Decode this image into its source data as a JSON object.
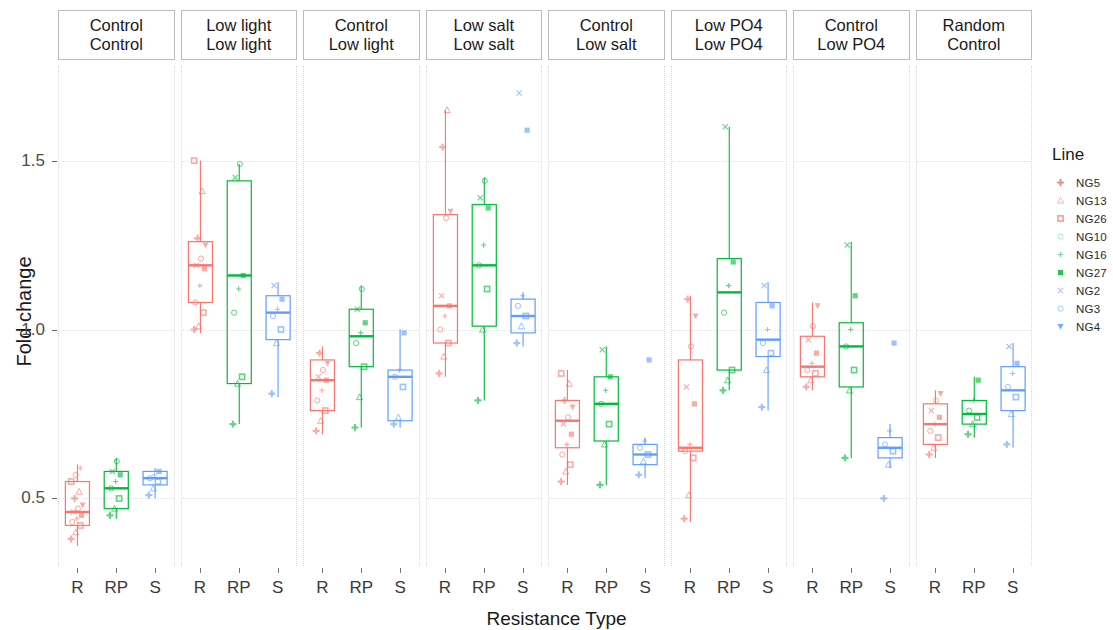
{
  "chart_data": {
    "type": "box",
    "title": "",
    "xlabel": "Resistance Type",
    "ylabel": "Fold change",
    "ylim": [
      0.3,
      1.78
    ],
    "yticks": [
      0.5,
      1.0,
      1.5
    ],
    "ytick_labels": [
      "0.5",
      "1.0",
      "1.5"
    ],
    "categories": [
      "R",
      "RP",
      "S"
    ],
    "grid": true,
    "legend_position": "right",
    "legend_title": "Line",
    "legend_entries": [
      {
        "label": "NG5",
        "shape": "plus-circle",
        "color": "#F8766D"
      },
      {
        "label": "NG13",
        "shape": "triangle",
        "color": "#FBA7A1"
      },
      {
        "label": "NG26",
        "shape": "square-x",
        "color": "#F08D86"
      },
      {
        "label": "NG10",
        "shape": "circle-open",
        "color": "#9FE3B9"
      },
      {
        "label": "NG16",
        "shape": "plus",
        "color": "#63C98A"
      },
      {
        "label": "NG27",
        "shape": "square",
        "color": "#00BA38"
      },
      {
        "label": "NG2",
        "shape": "cross",
        "color": "#A8B9F5"
      },
      {
        "label": "NG3",
        "shape": "circle-open",
        "color": "#8FC3F5"
      },
      {
        "label": "NG4",
        "shape": "triangle-down",
        "color": "#619CFF"
      }
    ],
    "group_colors": {
      "R": "#F8766D",
      "RP": "#00BA38",
      "S": "#619CFF"
    },
    "panels": [
      {
        "header_top": "Control",
        "header_bottom": "Control",
        "boxes": [
          {
            "group": "R",
            "lower_whisker": 0.36,
            "q1": 0.42,
            "median": 0.46,
            "q3": 0.55,
            "upper_whisker": 0.6,
            "points": [
              0.38,
              0.4,
              0.42,
              0.43,
              0.44,
              0.45,
              0.46,
              0.47,
              0.48,
              0.5,
              0.52,
              0.55,
              0.57,
              0.59
            ]
          },
          {
            "group": "RP",
            "lower_whisker": 0.44,
            "q1": 0.47,
            "median": 0.53,
            "q3": 0.58,
            "upper_whisker": 0.62,
            "points": [
              0.45,
              0.47,
              0.5,
              0.53,
              0.55,
              0.57,
              0.58,
              0.61
            ]
          },
          {
            "group": "S",
            "lower_whisker": 0.5,
            "q1": 0.54,
            "median": 0.56,
            "q3": 0.58,
            "upper_whisker": 0.59,
            "points": [
              0.51,
              0.53,
              0.55,
              0.56,
              0.57,
              0.58
            ]
          }
        ]
      },
      {
        "header_top": "Low light",
        "header_bottom": "Low light",
        "boxes": [
          {
            "group": "R",
            "lower_whisker": 0.99,
            "q1": 1.08,
            "median": 1.19,
            "q3": 1.26,
            "upper_whisker": 1.5,
            "points": [
              1.0,
              1.01,
              1.05,
              1.08,
              1.13,
              1.18,
              1.19,
              1.21,
              1.25,
              1.27,
              1.41,
              1.5
            ]
          },
          {
            "group": "RP",
            "lower_whisker": 0.72,
            "q1": 0.84,
            "median": 1.16,
            "q3": 1.44,
            "upper_whisker": 1.49,
            "points": [
              0.72,
              0.84,
              0.86,
              1.05,
              1.12,
              1.16,
              1.45,
              1.49
            ]
          },
          {
            "group": "S",
            "lower_whisker": 0.8,
            "q1": 0.97,
            "median": 1.05,
            "q3": 1.1,
            "upper_whisker": 1.14,
            "points": [
              0.81,
              0.96,
              1.0,
              1.04,
              1.06,
              1.09,
              1.13
            ]
          }
        ]
      },
      {
        "header_top": "Control",
        "header_bottom": "Low light",
        "boxes": [
          {
            "group": "R",
            "lower_whisker": 0.69,
            "q1": 0.76,
            "median": 0.85,
            "q3": 0.91,
            "upper_whisker": 0.95,
            "points": [
              0.7,
              0.73,
              0.76,
              0.79,
              0.82,
              0.85,
              0.86,
              0.88,
              0.9,
              0.93
            ]
          },
          {
            "group": "RP",
            "lower_whisker": 0.71,
            "q1": 0.89,
            "median": 0.98,
            "q3": 1.06,
            "upper_whisker": 1.13,
            "points": [
              0.71,
              0.8,
              0.89,
              0.96,
              0.99,
              1.02,
              1.06,
              1.12
            ]
          },
          {
            "group": "S",
            "lower_whisker": 0.71,
            "q1": 0.73,
            "median": 0.86,
            "q3": 0.88,
            "upper_whisker": 1.0,
            "points": [
              0.72,
              0.74,
              0.83,
              0.86,
              0.88,
              0.99
            ]
          }
        ]
      },
      {
        "header_top": "Low salt",
        "header_bottom": "Low salt",
        "boxes": [
          {
            "group": "R",
            "lower_whisker": 0.86,
            "q1": 0.96,
            "median": 1.07,
            "q3": 1.34,
            "upper_whisker": 1.65,
            "points": [
              0.87,
              0.92,
              0.96,
              1.0,
              1.04,
              1.07,
              1.1,
              1.33,
              1.35,
              1.54,
              1.65
            ]
          },
          {
            "group": "RP",
            "lower_whisker": 0.79,
            "q1": 1.01,
            "median": 1.19,
            "q3": 1.37,
            "upper_whisker": 1.45,
            "points": [
              0.79,
              1.0,
              1.12,
              1.19,
              1.25,
              1.36,
              1.39,
              1.44
            ]
          },
          {
            "group": "S",
            "lower_whisker": 0.95,
            "q1": 0.99,
            "median": 1.04,
            "q3": 1.09,
            "upper_whisker": 1.11,
            "points": [
              0.96,
              1.01,
              1.04,
              1.07,
              1.1,
              1.59,
              1.7
            ]
          }
        ]
      },
      {
        "header_top": "Control",
        "header_bottom": "Low salt",
        "boxes": [
          {
            "group": "R",
            "lower_whisker": 0.54,
            "q1": 0.65,
            "median": 0.73,
            "q3": 0.79,
            "upper_whisker": 0.88,
            "points": [
              0.55,
              0.58,
              0.6,
              0.63,
              0.66,
              0.69,
              0.72,
              0.74,
              0.77,
              0.79,
              0.84,
              0.87
            ]
          },
          {
            "group": "RP",
            "lower_whisker": 0.54,
            "q1": 0.67,
            "median": 0.78,
            "q3": 0.86,
            "upper_whisker": 0.95,
            "points": [
              0.54,
              0.66,
              0.72,
              0.78,
              0.82,
              0.86,
              0.94
            ]
          },
          {
            "group": "S",
            "lower_whisker": 0.56,
            "q1": 0.6,
            "median": 0.63,
            "q3": 0.66,
            "upper_whisker": 0.68,
            "points": [
              0.57,
              0.61,
              0.63,
              0.65,
              0.67,
              0.91
            ]
          }
        ]
      },
      {
        "header_top": "Low PO4",
        "header_bottom": "Low PO4",
        "boxes": [
          {
            "group": "R",
            "lower_whisker": 0.43,
            "q1": 0.64,
            "median": 0.65,
            "q3": 0.91,
            "upper_whisker": 1.1,
            "points": [
              0.44,
              0.51,
              0.62,
              0.64,
              0.66,
              0.78,
              0.83,
              0.95,
              1.04,
              1.09
            ]
          },
          {
            "group": "RP",
            "lower_whisker": 0.82,
            "q1": 0.88,
            "median": 1.11,
            "q3": 1.21,
            "upper_whisker": 1.6,
            "points": [
              0.82,
              0.85,
              0.88,
              1.05,
              1.13,
              1.2,
              1.6
            ]
          },
          {
            "group": "S",
            "lower_whisker": 0.76,
            "q1": 0.92,
            "median": 0.97,
            "q3": 1.08,
            "upper_whisker": 1.14,
            "points": [
              0.77,
              0.88,
              0.93,
              0.96,
              1.0,
              1.07,
              1.13
            ]
          }
        ]
      },
      {
        "header_top": "Control",
        "header_bottom": "Low PO4",
        "boxes": [
          {
            "group": "R",
            "lower_whisker": 0.82,
            "q1": 0.86,
            "median": 0.89,
            "q3": 0.98,
            "upper_whisker": 1.08,
            "points": [
              0.83,
              0.85,
              0.87,
              0.88,
              0.9,
              0.93,
              0.97,
              1.01,
              1.07
            ]
          },
          {
            "group": "RP",
            "lower_whisker": 0.62,
            "q1": 0.83,
            "median": 0.95,
            "q3": 1.02,
            "upper_whisker": 1.26,
            "points": [
              0.62,
              0.82,
              0.88,
              0.95,
              1.0,
              1.1,
              1.25
            ]
          },
          {
            "group": "S",
            "lower_whisker": 0.59,
            "q1": 0.62,
            "median": 0.65,
            "q3": 0.68,
            "upper_whisker": 0.72,
            "points": [
              0.5,
              0.6,
              0.64,
              0.66,
              0.7,
              0.96
            ]
          }
        ]
      },
      {
        "header_top": "Random",
        "header_bottom": "Control",
        "boxes": [
          {
            "group": "R",
            "lower_whisker": 0.62,
            "q1": 0.66,
            "median": 0.72,
            "q3": 0.78,
            "upper_whisker": 0.82,
            "points": [
              0.63,
              0.65,
              0.68,
              0.7,
              0.72,
              0.74,
              0.76,
              0.79,
              0.81
            ]
          },
          {
            "group": "RP",
            "lower_whisker": 0.68,
            "q1": 0.72,
            "median": 0.75,
            "q3": 0.79,
            "upper_whisker": 0.86,
            "points": [
              0.69,
              0.72,
              0.74,
              0.76,
              0.79,
              0.85
            ]
          },
          {
            "group": "S",
            "lower_whisker": 0.65,
            "q1": 0.76,
            "median": 0.82,
            "q3": 0.89,
            "upper_whisker": 0.96,
            "points": [
              0.66,
              0.75,
              0.8,
              0.83,
              0.87,
              0.9,
              0.95
            ]
          }
        ]
      }
    ]
  }
}
